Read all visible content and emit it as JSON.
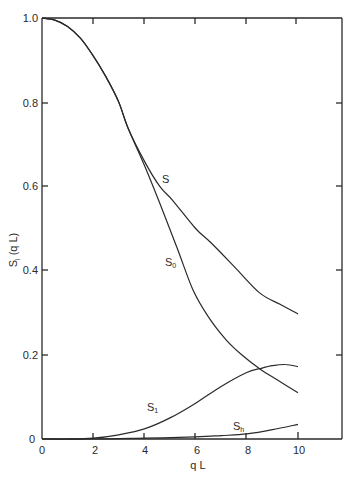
{
  "chart_data": {
    "type": "line",
    "title": "",
    "xlabel": "q L",
    "ylabel": "S_i (q L)",
    "xlim": [
      0,
      10
    ],
    "ylim": [
      0,
      1.0
    ],
    "grid": false,
    "legend": "none (curves labeled inline)",
    "x_ticks": [
      0,
      2,
      4,
      6,
      8,
      10
    ],
    "y_ticks": [
      0,
      0.2,
      0.4,
      0.6,
      0.8,
      1.0
    ],
    "x_tick_labels": [
      "0",
      "2",
      "4",
      "6",
      "8",
      "10"
    ],
    "y_tick_labels": [
      "0",
      "0.2",
      "0.4",
      "0.6",
      "0.8",
      "1.0"
    ],
    "series": [
      {
        "name": "S",
        "label": "S",
        "x": [
          0,
          0.5,
          1,
          1.5,
          2,
          2.5,
          3,
          3.35,
          4,
          4.6,
          5.1,
          6,
          6.6,
          7.5,
          8.5,
          9.3,
          10
        ],
        "y": [
          1.0,
          0.995,
          0.98,
          0.952,
          0.91,
          0.86,
          0.8,
          0.74,
          0.66,
          0.6,
          0.567,
          0.5,
          0.466,
          0.41,
          0.347,
          0.32,
          0.297
        ]
      },
      {
        "name": "S0",
        "label": "S",
        "label_sub": "0",
        "x": [
          0,
          0.5,
          1,
          1.5,
          2,
          2.5,
          3,
          3.35,
          4,
          4.6,
          5.3,
          5.9,
          6.5,
          7.2,
          7.8,
          8.5,
          9.2,
          10
        ],
        "y": [
          1.0,
          0.995,
          0.98,
          0.952,
          0.91,
          0.86,
          0.8,
          0.74,
          0.65,
          0.56,
          0.45,
          0.354,
          0.29,
          0.235,
          0.2,
          0.167,
          0.14,
          0.11
        ]
      },
      {
        "name": "S1",
        "label": "S",
        "label_sub": "1",
        "x": [
          0,
          1,
          2,
          3,
          4,
          5,
          6,
          7,
          8,
          8.5,
          9,
          9.5,
          10
        ],
        "y": [
          0,
          0.0,
          0.002,
          0.01,
          0.024,
          0.05,
          0.085,
          0.125,
          0.158,
          0.167,
          0.174,
          0.177,
          0.172
        ]
      },
      {
        "name": "Sh",
        "label": "S",
        "label_sub": "h",
        "x": [
          0,
          2,
          4,
          6,
          7,
          8,
          9,
          10
        ],
        "y": [
          0,
          0.0,
          0.002,
          0.005,
          0.008,
          0.012,
          0.022,
          0.035
        ]
      }
    ]
  },
  "labels": {
    "xlabel": "q L",
    "ylabel_main": "S",
    "ylabel_sub": "i",
    "ylabel_rest": " (q L)",
    "curve_S": "S",
    "curve_S0_main": "S",
    "curve_S0_sub": "0",
    "curve_S1_main": "S",
    "curve_S1_sub": "1",
    "curve_Sh_main": "S",
    "curve_Sh_sub": "h",
    "origin_y": "0",
    "x0": "0",
    "x2": "2",
    "x4": "4",
    "x6": "6",
    "x8": "8",
    "x10": "10",
    "y02": "0.2",
    "y04": "0.4",
    "y06": "0.6",
    "y08": "0.8",
    "y10": "1.0"
  }
}
